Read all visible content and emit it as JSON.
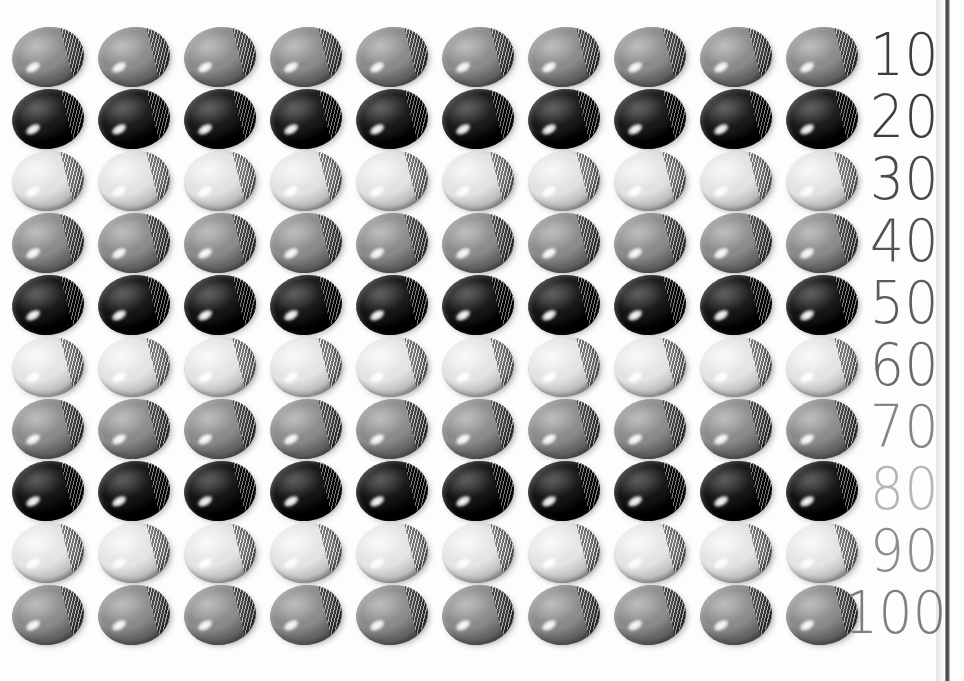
{
  "canvas": {
    "width": 964,
    "height": 681,
    "background": "#fdfdfd"
  },
  "page_edge": {
    "name": "page-edge-rule",
    "x": 945,
    "color": "#3a3a3a"
  },
  "grid": {
    "columns": 10,
    "rows": 10,
    "col_start_x": 48,
    "col_step": 86,
    "row_start_y": 57,
    "row_step": 62,
    "disc_width": 72,
    "disc_height": 60
  },
  "chart_data": {
    "type": "table",
    "title": "",
    "xlabel": "",
    "ylabel": "",
    "row_labels": [
      "10",
      "20",
      "30",
      "40",
      "50",
      "60",
      "70",
      "80",
      "90",
      "100"
    ],
    "categories": [
      "1",
      "2",
      "3",
      "4",
      "5",
      "6",
      "7",
      "8",
      "9",
      "10"
    ],
    "values": [
      10,
      20,
      30,
      40,
      50,
      60,
      70,
      80,
      90,
      100
    ],
    "counts_per_row": [
      10,
      10,
      10,
      10,
      10,
      10,
      10,
      10,
      10,
      10
    ],
    "total_items": 100
  },
  "rows": [
    {
      "label": "10",
      "count": 10,
      "disc_style": "gray",
      "label_color": "#3d3d3d",
      "base": "#8a8a8a",
      "light": "#adadad",
      "dark": "#676767"
    },
    {
      "label": "20",
      "count": 10,
      "disc_style": "black",
      "label_color": "#3f3f3f",
      "base": "#17171a",
      "light": "#3a3a3e",
      "dark": "#000000"
    },
    {
      "label": "30",
      "count": 10,
      "disc_style": "white",
      "label_color": "#4a4a4a",
      "base": "#e2e2e0",
      "light": "#f6f6f5",
      "dark": "#c3c3c1"
    },
    {
      "label": "40",
      "count": 10,
      "disc_style": "gray",
      "label_color": "#535353",
      "base": "#8a8a8a",
      "light": "#adadad",
      "dark": "#676767"
    },
    {
      "label": "50",
      "count": 10,
      "disc_style": "black",
      "label_color": "#5c5c5c",
      "base": "#141417",
      "light": "#37373b",
      "dark": "#000000"
    },
    {
      "label": "60",
      "count": 10,
      "disc_style": "white",
      "label_color": "#6a6a6a",
      "base": "#e4e4e2",
      "light": "#f8f8f7",
      "dark": "#c6c6c4"
    },
    {
      "label": "70",
      "count": 10,
      "disc_style": "gray",
      "label_color": "#858585",
      "base": "#8a8a8a",
      "light": "#adadad",
      "dark": "#676767"
    },
    {
      "label": "80",
      "count": 10,
      "disc_style": "black",
      "label_color": "#b6b6b6",
      "base": "#121215",
      "light": "#343438",
      "dark": "#000000"
    },
    {
      "label": "90",
      "count": 10,
      "disc_style": "white",
      "label_color": "#8e8e8e",
      "base": "#e4e4e2",
      "light": "#f8f8f7",
      "dark": "#c6c6c4"
    },
    {
      "label": "100",
      "count": 10,
      "disc_style": "gray",
      "label_color": "#7f7f7f",
      "base": "#8a8a8a",
      "light": "#adadad",
      "dark": "#676767"
    }
  ]
}
